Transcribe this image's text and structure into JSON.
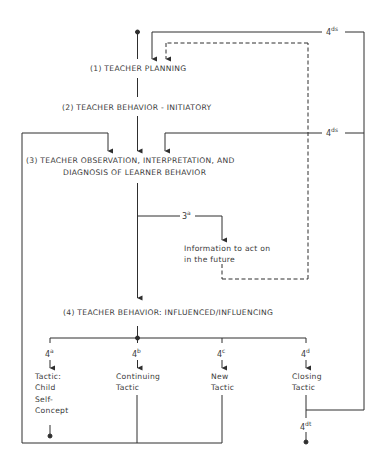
{
  "diagram": {
    "type": "flowchart",
    "nodes": {
      "n1": "(1) TEACHER PLANNING",
      "n2": "(2) TEACHER BEHAVIOR - INITIATORY",
      "n3_line1": "(3) TEACHER OBSERVATION, INTERPRETATION, AND",
      "n3_line2": "DIAGNOSIS OF LEARNER BEHAVIOR",
      "info": "Information to act on\nin the future",
      "n4": "(4) TEACHER BEHAVIOR: INFLUENCED/INFLUENCING",
      "tactic_a": "Tactic:\nChild\nSelf-\nConcept",
      "tactic_b": "Continuing\nTactic",
      "tactic_c": "New\nTactic",
      "tactic_d": "Closing\nTactic"
    },
    "codes": {
      "c3a": {
        "base": "3",
        "sup": "a"
      },
      "c4a": {
        "base": "4",
        "sup": "a"
      },
      "c4b": {
        "base": "4",
        "sup": "b"
      },
      "c4c": {
        "base": "4",
        "sup": "c"
      },
      "c4d": {
        "base": "4",
        "sup": "d"
      },
      "c4ds_top": {
        "base": "4",
        "sup": "ds"
      },
      "c4ds_mid": {
        "base": "4",
        "sup": "ds"
      },
      "c4dt": {
        "base": "4",
        "sup": "dt"
      }
    },
    "colors": {
      "line": "#2e2e2e",
      "background": "#ffffff"
    }
  }
}
